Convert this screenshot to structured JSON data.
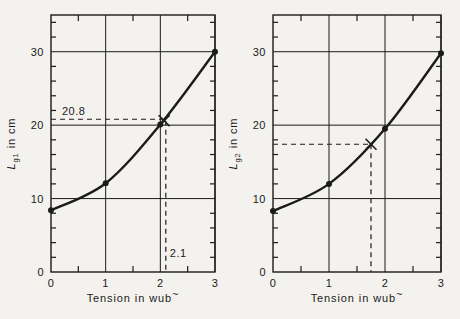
{
  "page": {
    "background": "#f4f2ee",
    "ink": "#1b1b1b"
  },
  "chart_data": [
    {
      "type": "line",
      "title": "",
      "ylabel_parts": {
        "main": "L",
        "sub": "g1",
        "rest": " in cm"
      },
      "xlabel_parts": {
        "text": "Tension in wub",
        "sup": "~"
      },
      "xlim": [
        0,
        3
      ],
      "ylim": [
        0,
        35
      ],
      "xticks": [
        0,
        1,
        2,
        3
      ],
      "yticks": [
        0,
        10,
        20,
        30
      ],
      "x_minor": [
        0.5,
        1.5,
        2.5
      ],
      "y_minor_step": 2,
      "grid": true,
      "x": [
        0,
        1,
        2,
        3
      ],
      "y": [
        8.4,
        12.1,
        20.1,
        30
      ],
      "annotation": {
        "cross": [
          2.07,
          20.6
        ],
        "h_dash_y": 20.8,
        "h_dash_label": "20.8",
        "v_dash_x": 2.1,
        "v_dash_label": "2.1"
      }
    },
    {
      "type": "line",
      "title": "",
      "ylabel_parts": {
        "main": "L",
        "sub": "g2",
        "rest": " in cm"
      },
      "xlabel_parts": {
        "text": "Tension in wub",
        "sup": "~"
      },
      "xlim": [
        0,
        3
      ],
      "ylim": [
        0,
        35
      ],
      "xticks": [
        0,
        1,
        2,
        3
      ],
      "yticks": [
        0,
        10,
        20,
        30
      ],
      "x_minor": [
        0.5,
        1.5,
        2.5
      ],
      "y_minor_step": 2,
      "grid": true,
      "x": [
        0,
        1,
        2,
        3
      ],
      "y": [
        8.3,
        12.0,
        19.5,
        29.8
      ],
      "annotation": {
        "cross": [
          1.75,
          17.4
        ],
        "h_dash_y": 17.4,
        "h_dash_label": null,
        "v_dash_x": 1.75,
        "v_dash_label": null
      }
    }
  ]
}
